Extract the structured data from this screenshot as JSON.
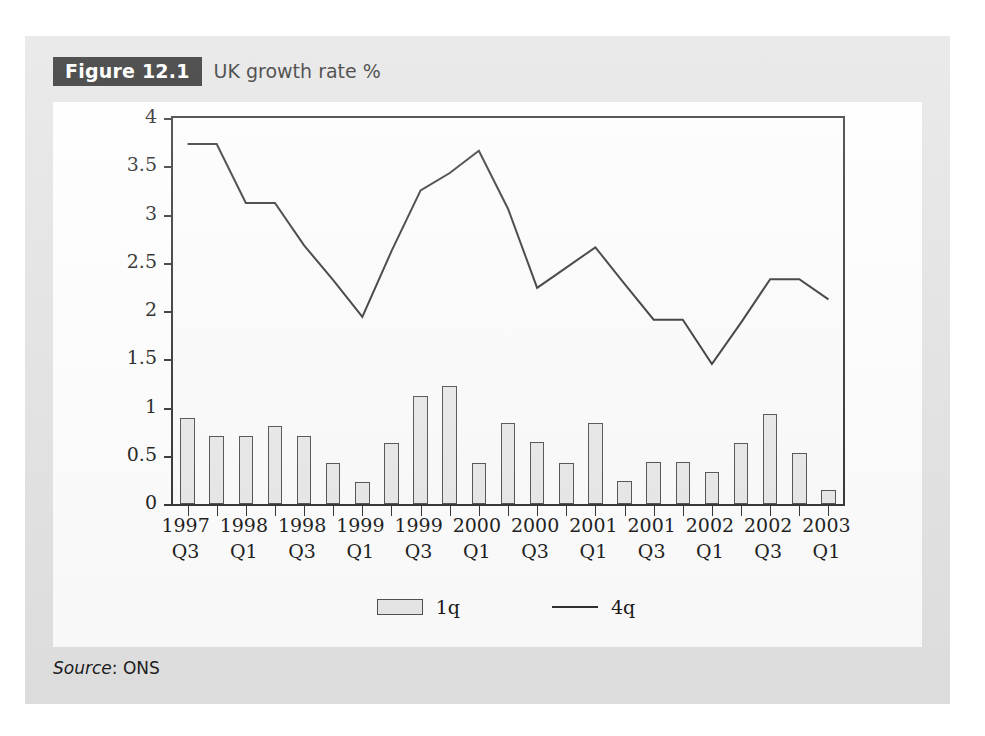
{
  "figure": {
    "tag": "Figure 12.1",
    "title": "UK growth rate %",
    "source_label": "Source",
    "source_value": ": ONS"
  },
  "chart_data": {
    "type": "bar",
    "title": "UK growth rate %",
    "xlabel": "",
    "ylabel": "",
    "ylim": [
      0,
      4
    ],
    "yticks": [
      0,
      0.5,
      1,
      1.5,
      2,
      2.5,
      3,
      3.5,
      4
    ],
    "ytick_labels": [
      "0",
      "0.5",
      "1",
      "1.5",
      "2",
      "2.5",
      "3",
      "3.5",
      "4"
    ],
    "grid": false,
    "legend_position": "bottom",
    "categories": [
      "1997 Q3",
      "1997 Q4",
      "1998 Q1",
      "1998 Q2",
      "1998 Q3",
      "1998 Q4",
      "1999 Q1",
      "1999 Q2",
      "1999 Q3",
      "1999 Q4",
      "2000 Q1",
      "2000 Q2",
      "2000 Q3",
      "2000 Q4",
      "2001 Q1",
      "2001 Q2",
      "2001 Q3",
      "2001 Q4",
      "2002 Q1",
      "2002 Q2",
      "2002 Q3",
      "2002 Q4",
      "2003 Q1"
    ],
    "tick_labels": [
      {
        "year": "1997",
        "quarter": "Q3"
      },
      {
        "year": "",
        "quarter": ""
      },
      {
        "year": "1998",
        "quarter": "Q1"
      },
      {
        "year": "",
        "quarter": ""
      },
      {
        "year": "1998",
        "quarter": "Q3"
      },
      {
        "year": "",
        "quarter": ""
      },
      {
        "year": "1999",
        "quarter": "Q1"
      },
      {
        "year": "",
        "quarter": ""
      },
      {
        "year": "1999",
        "quarter": "Q3"
      },
      {
        "year": "",
        "quarter": ""
      },
      {
        "year": "2000",
        "quarter": "Q1"
      },
      {
        "year": "",
        "quarter": ""
      },
      {
        "year": "2000",
        "quarter": "Q3"
      },
      {
        "year": "",
        "quarter": ""
      },
      {
        "year": "2001",
        "quarter": "Q1"
      },
      {
        "year": "",
        "quarter": ""
      },
      {
        "year": "2001",
        "quarter": "Q3"
      },
      {
        "year": "",
        "quarter": ""
      },
      {
        "year": "2002",
        "quarter": "Q1"
      },
      {
        "year": "",
        "quarter": ""
      },
      {
        "year": "2002",
        "quarter": "Q3"
      },
      {
        "year": "",
        "quarter": ""
      },
      {
        "year": "2003",
        "quarter": "Q1"
      }
    ],
    "series": [
      {
        "name": "1q",
        "type": "bar",
        "color": "#e9e9e9",
        "edge_color": "#4a4a4a",
        "values": [
          0.89,
          0.71,
          0.71,
          0.81,
          0.71,
          0.42,
          0.23,
          0.63,
          1.12,
          1.22,
          0.43,
          0.84,
          0.64,
          0.43,
          0.84,
          0.24,
          0.44,
          0.44,
          0.33,
          0.63,
          0.93,
          0.53,
          0.15
        ]
      },
      {
        "name": "4q",
        "type": "line",
        "color": "#2a2a2a",
        "values": [
          3.73,
          3.73,
          3.12,
          3.12,
          2.68,
          2.32,
          1.94,
          2.62,
          3.25,
          3.43,
          3.66,
          3.06,
          2.24,
          2.45,
          2.66,
          2.28,
          1.91,
          1.91,
          1.45,
          1.88,
          2.33,
          2.33,
          2.12
        ]
      }
    ],
    "legend": [
      {
        "label": "1q",
        "marker": "bar"
      },
      {
        "label": "4q",
        "marker": "line"
      }
    ]
  }
}
